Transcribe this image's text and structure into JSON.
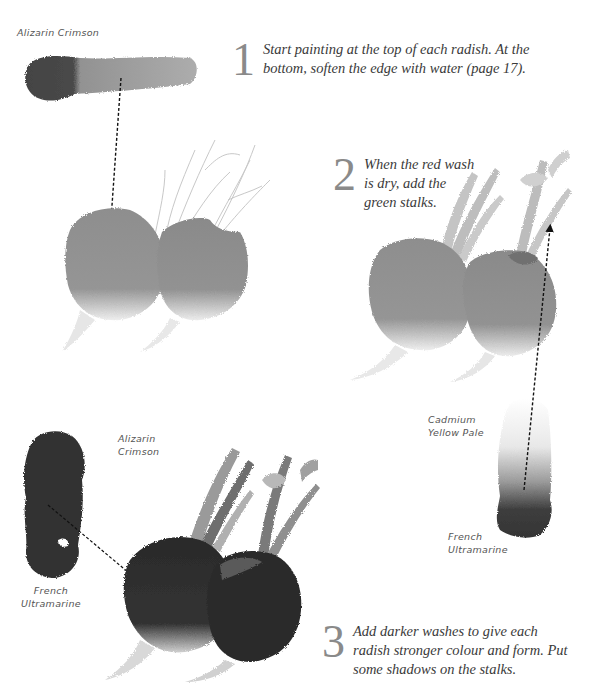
{
  "page": {
    "background": "#ffffff",
    "ink_color": "#3a3a3a",
    "paint_tones": {
      "light_wash": "#8f8f8f",
      "dark_wash": "#2e2e2e",
      "stalk": "#b5b5b5"
    }
  },
  "steps": [
    {
      "number": "1",
      "text": "Start painting at the top of each radish. At the bottom, soften the edge with water (page 17)."
    },
    {
      "number": "2",
      "text": "When the red wash is dry, add the green stalks."
    },
    {
      "number": "3",
      "text": "Add darker washes to give each radish stronger colour and form. Put some shadows on the stalks."
    }
  ],
  "labels": {
    "step1_swatch": "Alizarin Crimson",
    "step2_swatch_top": "Cadmium Yellow Pale",
    "step2_swatch_bottom": "French Ultramarine",
    "step3_swatch_top": "Alizarin Crimson",
    "step3_swatch_bottom": "French Ultramarine"
  },
  "illustrations": [
    {
      "name": "step1-radishes",
      "description": "two radishes with light red wash, pencil-outlined stalks"
    },
    {
      "name": "step2-radishes",
      "description": "two radishes with red wash and green stalks added"
    },
    {
      "name": "step3-radishes",
      "description": "two radishes with darker washes and shadowed stalks"
    }
  ]
}
